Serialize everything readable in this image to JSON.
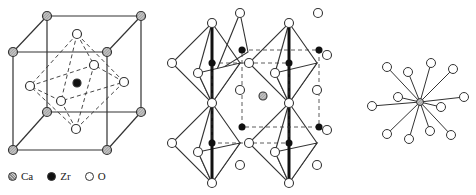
{
  "figure": {
    "panels": [
      {
        "name": "unit-cell",
        "description": "CaZrO3 perovskite unit cell with ZrO6 octahedron"
      },
      {
        "name": "octahedra-network",
        "description": "Corner-sharing ZrO6 octahedra with Ca at center"
      },
      {
        "name": "ca-coordination",
        "description": "Ca coordinated by 12 O atoms"
      }
    ],
    "legend": [
      {
        "symbol": "hatched-circle",
        "label": "Ca"
      },
      {
        "symbol": "black-circle",
        "label": "Zr"
      },
      {
        "symbol": "open-circle",
        "label": "O"
      }
    ]
  },
  "colors": {
    "line": "#333333",
    "zr": "#111111",
    "ca": "#999999",
    "o": "#ffffff"
  }
}
